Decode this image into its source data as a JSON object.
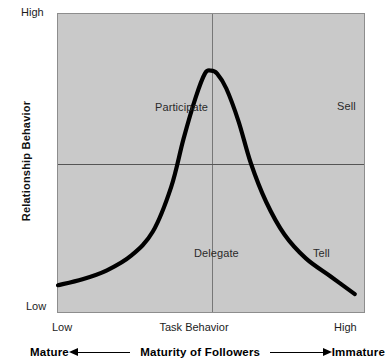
{
  "chart_data": {
    "type": "line",
    "xlabel": "Task Behavior",
    "ylabel": "Relationship Behavior",
    "xlim": [
      0,
      100
    ],
    "ylim": [
      0,
      100
    ],
    "grid": true,
    "legend_position": "none",
    "x_tick_labels": [
      "Low",
      "High"
    ],
    "y_tick_labels": [
      "Low",
      "High"
    ],
    "gridlines": {
      "x": [
        50
      ],
      "y": [
        50
      ]
    },
    "annotations": [
      {
        "label": "Participate",
        "x": 24,
        "y": 73,
        "quadrant": "upper-left"
      },
      {
        "label": "Sell",
        "x": 76,
        "y": 73,
        "quadrant": "upper-right"
      },
      {
        "label": "Delegate",
        "x": 35,
        "y": 25,
        "quadrant": "lower-left"
      },
      {
        "label": "Tell",
        "x": 68,
        "y": 25,
        "quadrant": "lower-right"
      }
    ],
    "series": [
      {
        "name": "Leadership style curve",
        "color": "#000000",
        "x": [
          0,
          8,
          16,
          24,
          31,
          37,
          41,
          45,
          48,
          50,
          52,
          55,
          59,
          63,
          68,
          74,
          81,
          89,
          97
        ],
        "y": [
          9,
          11,
          14,
          19,
          27,
          42,
          58,
          72,
          80,
          81,
          80,
          75,
          64,
          50,
          37,
          26,
          18,
          12,
          6
        ]
      }
    ],
    "maturity_axis": {
      "label": "Maturity of Followers",
      "left_end": "Mature",
      "right_end": "Immature",
      "direction": "bidirectional"
    }
  },
  "axes": {
    "y_title": "Relationship Behavior",
    "y_high": "High",
    "y_low": "Low",
    "x_title": "Task Behavior",
    "x_low": "Low",
    "x_high": "High"
  },
  "quadrants": {
    "participate": "Participate",
    "sell": "Sell",
    "delegate": "Delegate",
    "tell": "Tell"
  },
  "maturity": {
    "left_end": "Mature",
    "center_label": "Maturity of Followers",
    "right_end": "Immature"
  },
  "colors": {
    "plot_background": "#c9c9c9",
    "plot_border": "#8d8d8d",
    "curve": "#000000",
    "gridline": "#666666",
    "text": "#1c1c1c"
  }
}
